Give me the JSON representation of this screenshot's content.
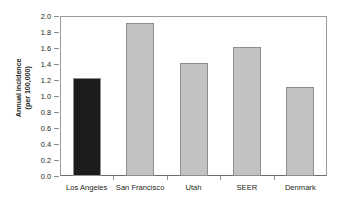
{
  "chart_data": {
    "type": "bar",
    "title": "",
    "subtitle": "",
    "xlabel": "",
    "ylabel": "Annual incidence\n(per 100,000)",
    "ylabel_line1": "Annual incidence",
    "ylabel_line2": "(per 100,000)",
    "categories": [
      "Los Angeles",
      "San Francisco",
      "Utah",
      "SEER",
      "Denmark"
    ],
    "values": [
      1.23,
      1.91,
      1.41,
      1.61,
      1.11
    ],
    "ylim": [
      0.0,
      2.0
    ],
    "ytick_labels": [
      "2.0",
      "1.8",
      "1.6",
      "1.4",
      "1.2",
      "1.0",
      "0.8",
      "0.6",
      "0.4",
      "0.2",
      "0.0"
    ],
    "ytick_values": [
      2.0,
      1.8,
      1.6,
      1.4,
      1.2,
      1.0,
      0.8,
      0.6,
      0.4,
      0.2,
      0.0
    ],
    "grid": false,
    "legend": "none",
    "bar_colors": [
      "#1c1c1c",
      "#c2c2c2",
      "#c2c2c2",
      "#c2c2c2",
      "#c2c2c2"
    ],
    "bar_border_color": "#8e8e8e",
    "highlight_index": 0,
    "background_color": "#ffffff",
    "axis_color": "#8d8d8d",
    "text_color": "#231f20"
  }
}
